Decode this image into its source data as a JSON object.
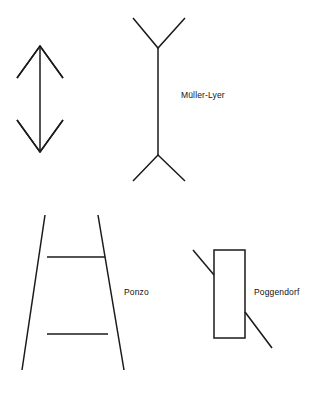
{
  "figure": {
    "background_color": "#ffffff",
    "line_color": "#1a1a1a",
    "width": 320,
    "height": 397
  },
  "labels": {
    "muller_lyer": "Müller-Lyer",
    "ponzo": "Ponzo",
    "poggendorf": "Poggendorf"
  },
  "chart_data": {
    "type": "diagram",
    "title": "",
    "subtitle": "",
    "xlabel": "",
    "ylabel": "",
    "grid": false,
    "legend": "none",
    "background_color": "#ffffff",
    "stroke_color": "#1a1a1a",
    "stroke_width": 1.5,
    "xlim": [
      0,
      320
    ],
    "ylim": [
      0,
      397
    ],
    "annotations": [
      {
        "text": "Müller-Lyer",
        "x": 181,
        "y": 96
      },
      {
        "text": "Ponzo",
        "x": 124,
        "y": 293
      },
      {
        "text": "Poggendorf",
        "x": 254,
        "y": 293
      }
    ],
    "shapes": [
      {
        "name": "double-arrow-shaft",
        "figure": "double-headed-arrow",
        "type": "polyline",
        "points": [
          [
            40,
            46
          ],
          [
            40,
            152
          ]
        ]
      },
      {
        "name": "double-arrow-head-top",
        "figure": "double-headed-arrow",
        "type": "polyline",
        "points": [
          [
            17,
            78
          ],
          [
            40,
            46
          ],
          [
            63,
            78
          ]
        ]
      },
      {
        "name": "double-arrow-head-bottom",
        "figure": "double-headed-arrow",
        "type": "polyline",
        "points": [
          [
            17,
            120
          ],
          [
            40,
            152
          ],
          [
            63,
            120
          ]
        ]
      },
      {
        "name": "muller-lyer-shaft",
        "figure": "muller-lyer",
        "type": "polyline",
        "points": [
          [
            158,
            48
          ],
          [
            158,
            155
          ]
        ]
      },
      {
        "name": "muller-lyer-fins-top",
        "figure": "muller-lyer",
        "type": "polyline",
        "points": [
          [
            133,
            18
          ],
          [
            158,
            48
          ],
          [
            185,
            18
          ]
        ]
      },
      {
        "name": "muller-lyer-fins-bottom",
        "figure": "muller-lyer",
        "type": "polyline",
        "points": [
          [
            133,
            181
          ],
          [
            158,
            155
          ],
          [
            185,
            181
          ]
        ]
      },
      {
        "name": "ponzo-rail-left",
        "figure": "ponzo",
        "type": "polyline",
        "points": [
          [
            45,
            215
          ],
          [
            22,
            370
          ]
        ]
      },
      {
        "name": "ponzo-rail-right",
        "figure": "ponzo",
        "type": "polyline",
        "points": [
          [
            98,
            215
          ],
          [
            124,
            370
          ]
        ]
      },
      {
        "name": "ponzo-bar-top",
        "figure": "ponzo",
        "type": "polyline",
        "points": [
          [
            47,
            257
          ],
          [
            105,
            257
          ]
        ]
      },
      {
        "name": "ponzo-bar-bottom",
        "figure": "ponzo",
        "type": "polyline",
        "points": [
          [
            47,
            334
          ],
          [
            108,
            334
          ]
        ]
      },
      {
        "name": "poggendorf-rectangle",
        "figure": "poggendorf",
        "type": "rect",
        "x": 214,
        "y": 250,
        "width": 31,
        "height": 88
      },
      {
        "name": "poggendorf-diagonal-upper",
        "figure": "poggendorf",
        "type": "polyline",
        "points": [
          [
            193,
            250
          ],
          [
            214,
            275
          ]
        ]
      },
      {
        "name": "poggendorf-diagonal-lower",
        "figure": "poggendorf",
        "type": "polyline",
        "points": [
          [
            245,
            312
          ],
          [
            272,
            348
          ]
        ]
      }
    ]
  }
}
